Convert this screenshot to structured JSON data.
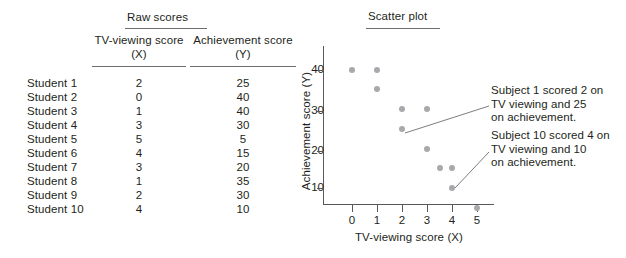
{
  "table": {
    "title": "Raw scores",
    "columns": [
      {
        "line1": "TV-viewing score",
        "line2": "(X)"
      },
      {
        "line1": "Achievement score",
        "line2": "(Y)"
      }
    ],
    "rows": [
      {
        "name": "Student 1",
        "x": "2",
        "y": "25"
      },
      {
        "name": "Student 2",
        "x": "0",
        "y": "40"
      },
      {
        "name": "Student 3",
        "x": "1",
        "y": "40"
      },
      {
        "name": "Student 4",
        "x": "3",
        "y": "30"
      },
      {
        "name": "Student 5",
        "x": "5",
        "y": "5"
      },
      {
        "name": "Student 6",
        "x": "4",
        "y": "15"
      },
      {
        "name": "Student 7",
        "x": "3",
        "y": "20"
      },
      {
        "name": "Student 8",
        "x": "1",
        "y": "35"
      },
      {
        "name": "Student 9",
        "x": "2",
        "y": "30"
      },
      {
        "name": "Student 10",
        "x": "4",
        "y": "10"
      }
    ]
  },
  "plot": {
    "title": "Scatter plot",
    "xlabel": "TV-viewing score (X)",
    "ylabel": "Achievement score (Y)",
    "ytick_labels": [
      "40",
      "30",
      "20",
      "10"
    ],
    "xtick_labels": [
      "0",
      "1",
      "2",
      "3",
      "4",
      "5"
    ],
    "annotations": [
      {
        "text": "Subject 1 scored 2 on\nTV viewing and 25\non achievement."
      },
      {
        "text": "Subject 10 scored 4 on\nTV viewing and 10\non achievement."
      }
    ]
  },
  "chart_data": {
    "type": "scatter",
    "title": "Scatter plot",
    "xlabel": "TV-viewing score (X)",
    "ylabel": "Achievement score (Y)",
    "xlim": [
      0,
      5
    ],
    "ylim": [
      0,
      45
    ],
    "xticks": [
      0,
      1,
      2,
      3,
      4,
      5
    ],
    "yticks": [
      10,
      20,
      30,
      40
    ],
    "grid": false,
    "legend": null,
    "point_color": "#a7a9ac",
    "points": [
      {
        "label": "Student 1",
        "x": 2,
        "y": 25
      },
      {
        "label": "Student 2",
        "x": 0,
        "y": 40
      },
      {
        "label": "Student 3",
        "x": 1,
        "y": 40
      },
      {
        "label": "Student 4",
        "x": 3,
        "y": 30
      },
      {
        "label": "Student 5",
        "x": 5,
        "y": 5
      },
      {
        "label": "Student 6",
        "x": 3.5,
        "y": 15
      },
      {
        "label": "Student 7",
        "x": 3,
        "y": 20
      },
      {
        "label": "Student 8",
        "x": 1,
        "y": 35
      },
      {
        "label": "Student 9",
        "x": 2,
        "y": 30
      },
      {
        "label": "Student 10",
        "x": 4,
        "y": 10
      },
      {
        "label": "Student 6b",
        "x": 4,
        "y": 15
      }
    ],
    "annotations": [
      {
        "text": "Subject 1 scored 2 on TV viewing and 25 on achievement.",
        "points_to": {
          "x": 2,
          "y": 25
        }
      },
      {
        "text": "Subject 10 scored 4 on TV viewing and 10 on achievement.",
        "points_to": {
          "x": 4,
          "y": 10
        }
      }
    ]
  }
}
